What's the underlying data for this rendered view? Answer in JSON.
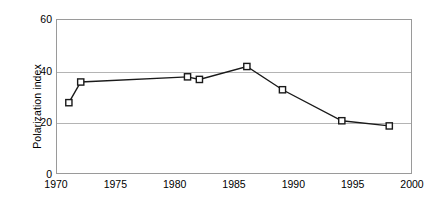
{
  "chart_data": {
    "type": "line",
    "title": "",
    "xlabel": "",
    "ylabel": "Polarization index",
    "xlim": [
      1970,
      2000
    ],
    "ylim": [
      0,
      60
    ],
    "xticks": [
      1970,
      1975,
      1980,
      1985,
      1990,
      1995,
      2000
    ],
    "yticks": [
      0,
      20,
      40,
      60
    ],
    "grid": true,
    "legend": false,
    "marker": "open-square",
    "line_color": "#1a1a1a",
    "marker_face_color": "#ffffff",
    "grid_color": "#b4b4b4",
    "x": [
      1971,
      1972,
      1981,
      1982,
      1986,
      1989,
      1994,
      1998
    ],
    "values": [
      28,
      36,
      38,
      37,
      42,
      33,
      21,
      19
    ],
    "series": [
      {
        "name": "Polarization index",
        "points": [
          {
            "x": 1971,
            "y": 28
          },
          {
            "x": 1972,
            "y": 36
          },
          {
            "x": 1981,
            "y": 38
          },
          {
            "x": 1982,
            "y": 37
          },
          {
            "x": 1986,
            "y": 42
          },
          {
            "x": 1989,
            "y": 33
          },
          {
            "x": 1994,
            "y": 21
          },
          {
            "x": 1998,
            "y": 19
          }
        ]
      }
    ]
  },
  "axes": {
    "y_title": "Polarization index",
    "y_tick_labels": [
      "0",
      "20",
      "40",
      "60"
    ],
    "x_tick_labels": [
      "1970",
      "1975",
      "1980",
      "1985",
      "1990",
      "1995",
      "2000"
    ]
  }
}
